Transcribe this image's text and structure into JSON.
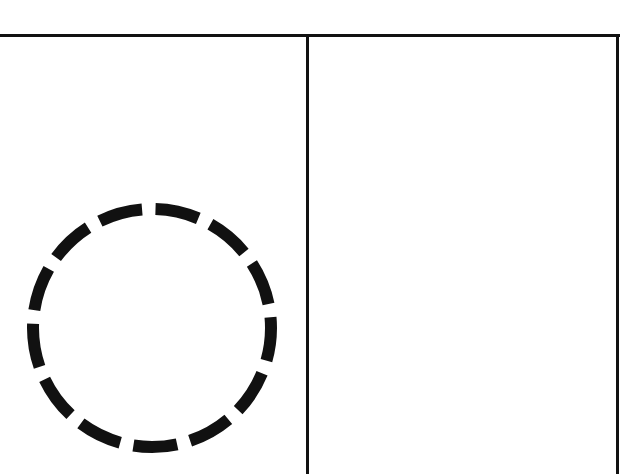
{
  "diagram": {
    "type": "two-panel frame with dashed circle",
    "colors": {
      "background": "#ffffff",
      "stroke": "#111111"
    },
    "frame": {
      "top_y": 35,
      "divider_x": 307,
      "right_x": 617,
      "line_width": 3
    },
    "panels": [
      {
        "name": "left-panel",
        "contents": [
          "dashed-circle"
        ]
      },
      {
        "name": "right-panel",
        "contents": []
      }
    ],
    "circle": {
      "cx": 152,
      "cy": 328,
      "r": 119,
      "stroke_width": 12,
      "dash_count": 13,
      "dash_length": 44,
      "gap_length": 13.5,
      "style": "dashed"
    }
  }
}
